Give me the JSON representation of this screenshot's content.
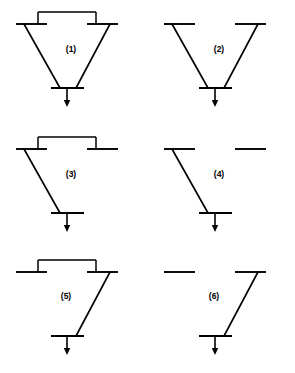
{
  "figure": {
    "type": "single-line-diagram-grid",
    "background_color": "#ffffff",
    "line_color": "#000000",
    "width": 295,
    "height": 373,
    "columns": 2,
    "rows": 3
  },
  "diagrams": [
    {
      "id": "d1",
      "label": "(1)",
      "label_x": 71,
      "label_y": 50,
      "origin_x": 0,
      "origin_y": 0,
      "top_tie_line": true,
      "left_bus": true,
      "right_bus": true,
      "left_feeder": true,
      "right_feeder": true,
      "load_arrow": true
    },
    {
      "id": "d2",
      "label": "(2)",
      "label_x": 219,
      "label_y": 50,
      "origin_x": 148,
      "origin_y": 0,
      "top_tie_line": false,
      "left_bus": true,
      "right_bus": true,
      "left_feeder": true,
      "right_feeder": true,
      "load_arrow": true
    },
    {
      "id": "d3",
      "label": "(3)",
      "label_x": 71,
      "label_y": 175,
      "origin_x": 0,
      "origin_y": 125,
      "top_tie_line": true,
      "left_bus": true,
      "right_bus": true,
      "left_feeder": true,
      "right_feeder": false,
      "load_arrow": true
    },
    {
      "id": "d4",
      "label": "(4)",
      "label_x": 219,
      "label_y": 175,
      "origin_x": 148,
      "origin_y": 125,
      "top_tie_line": false,
      "left_bus": true,
      "right_bus": true,
      "left_feeder": true,
      "right_feeder": false,
      "load_arrow": true
    },
    {
      "id": "d5",
      "label": "(5)",
      "label_x": 66,
      "label_y": 297,
      "origin_x": 0,
      "origin_y": 248,
      "top_tie_line": true,
      "left_bus": true,
      "right_bus": true,
      "left_feeder": false,
      "right_feeder": true,
      "load_arrow": true
    },
    {
      "id": "d6",
      "label": "(6)",
      "label_x": 214,
      "label_y": 297,
      "origin_x": 148,
      "origin_y": 248,
      "top_tie_line": false,
      "left_bus": true,
      "right_bus": true,
      "left_feeder": false,
      "right_feeder": true,
      "load_arrow": true
    }
  ],
  "geometry": {
    "left_bus_x1": 16,
    "left_bus_x2": 47,
    "right_bus_x1": 87,
    "right_bus_x2": 118,
    "top_bus_y": 24,
    "tie_y": 12,
    "tie_left_x": 38,
    "tie_right_x": 96,
    "bottom_bus_y": 88,
    "bottom_bus_x1": 51,
    "bottom_bus_x2": 84,
    "feeder_left_top_x": 24,
    "feeder_right_top_x": 110,
    "feeder_left_bottom_x": 60,
    "feeder_right_bottom_x": 76,
    "arrow_x": 67,
    "arrow_top_y": 88,
    "arrow_tip_y": 107,
    "arrow_head_half_width": 3.2,
    "arrow_head_height": 7
  }
}
